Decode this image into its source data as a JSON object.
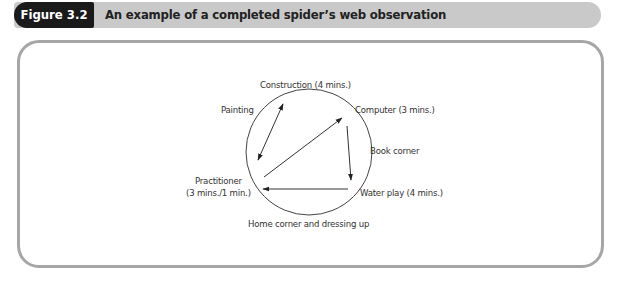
{
  "figure": {
    "tag": "Figure 3.2",
    "title": "An example of a completed spider’s web observation"
  },
  "diagram": {
    "type": "spider-web-observation",
    "nodes": [
      {
        "id": "construction",
        "label": "Construction (4 mins.)"
      },
      {
        "id": "painting",
        "label": "Painting"
      },
      {
        "id": "computer",
        "label": "Computer (3 mins.)"
      },
      {
        "id": "book_corner",
        "label": "Book corner"
      },
      {
        "id": "practitioner_line1",
        "label": "Practitioner"
      },
      {
        "id": "practitioner_line2",
        "label": "(3 mins./1 min.)"
      },
      {
        "id": "water_play",
        "label": "Water play (4 mins.)"
      },
      {
        "id": "home_corner",
        "label": "Home corner and dressing up"
      }
    ],
    "edges": [
      {
        "from": "practitioner",
        "to": "construction",
        "bidirectional": true
      },
      {
        "from": "practitioner",
        "to": "computer",
        "bidirectional": false
      },
      {
        "from": "computer",
        "to": "water_play",
        "bidirectional": false
      },
      {
        "from": "water_play",
        "to": "practitioner",
        "bidirectional": false
      }
    ],
    "colors": {
      "line": "#333333",
      "frame": "#a6a6a6",
      "header_bar": "#c9c9c9",
      "header_tag": "#1a1a1a"
    }
  }
}
